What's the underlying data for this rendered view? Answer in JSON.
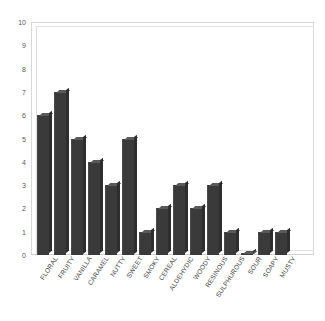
{
  "chart_data": {
    "type": "bar",
    "title": "",
    "subtitle": "",
    "xlabel": "",
    "ylabel": "",
    "ylim": [
      0,
      10
    ],
    "xlim": [
      0,
      16
    ],
    "grid": false,
    "legend": null,
    "legend_position": "none",
    "style": "3d-column",
    "bar_color": "#3a3a3a",
    "frame_color": "#d8d8d8",
    "y_ticks": [
      10,
      9,
      8,
      7,
      6,
      5,
      4,
      3,
      2,
      1,
      0
    ],
    "categories": [
      "FLORAL",
      "FRUITY",
      "VANILLA",
      "CARAMEL",
      "NUTTY",
      "SWEET",
      "SMOKY",
      "CEREAL",
      "ALDEHYDIC",
      "WOODY",
      "RESINOUS",
      "SULPHUROUS",
      "SOUR",
      "SOAPY",
      "MUSTY"
    ],
    "values": [
      6,
      7,
      5,
      4,
      3,
      5,
      1,
      2,
      3,
      2,
      3,
      1,
      0.1,
      1,
      1
    ],
    "series": [
      {
        "name": "",
        "values": [
          6,
          7,
          5,
          4,
          3,
          5,
          1,
          2,
          3,
          2,
          3,
          1,
          0.1,
          1,
          1
        ]
      }
    ]
  }
}
